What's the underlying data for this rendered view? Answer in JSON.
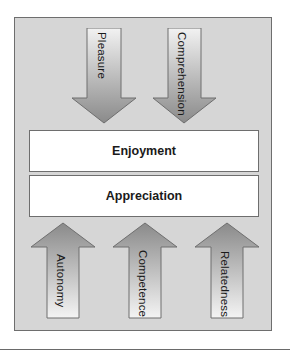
{
  "diagram": {
    "top_arrows": [
      {
        "label": "Pleasure",
        "direction": "down"
      },
      {
        "label": "Comprehension",
        "direction": "down"
      }
    ],
    "center_boxes": [
      {
        "label": "Enjoyment"
      },
      {
        "label": "Appreciation"
      }
    ],
    "bottom_arrows": [
      {
        "label": "Autonomy",
        "direction": "up"
      },
      {
        "label": "Competence",
        "direction": "up"
      },
      {
        "label": "Relatedness",
        "direction": "up"
      }
    ],
    "colors": {
      "frame_fill": "#d6d6d6",
      "frame_border": "#6e6e6e",
      "arrow_dark": "#8c8c8c",
      "arrow_light": "#f4f4f4",
      "box_fill": "#ffffff"
    }
  }
}
